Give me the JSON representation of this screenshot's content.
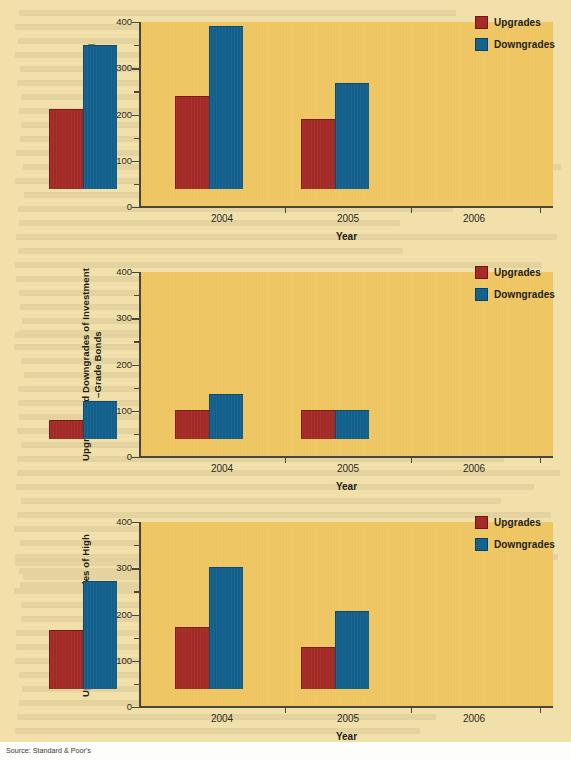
{
  "page": {
    "background_color": "#f1e0a9",
    "plot_background_color": "#eec561",
    "source_note": "Source: Standard & Poor's"
  },
  "colors": {
    "upgrades": "#a62a27",
    "downgrades": "#13628f",
    "axis": "#4a463c",
    "text": "#1d1d1a"
  },
  "legend": {
    "upgrades_label": "Upgrades",
    "downgrades_label": "Downgrades"
  },
  "axis": {
    "y_ticks": [
      "400",
      "300",
      "200",
      "100",
      "0"
    ],
    "x_categories": [
      "2004",
      "2005",
      "2006"
    ],
    "x_title": "Year"
  },
  "chart_data": [
    {
      "id": "chart1",
      "type": "bar",
      "title": "",
      "xlabel": "Year",
      "ylabel": "Total Number of Upgrades and Downgrades",
      "ylim": [
        0,
        400
      ],
      "yticks": [
        0,
        100,
        200,
        300,
        400
      ],
      "grid": false,
      "legend_position": "top-right",
      "categories": [
        "2004",
        "2005",
        "2006"
      ],
      "series": [
        {
          "name": "Upgrades",
          "color": "#a62a27",
          "values": [
            170,
            200,
            150
          ]
        },
        {
          "name": "Downgrades",
          "color": "#13628f",
          "values": [
            310,
            350,
            227
          ]
        }
      ]
    },
    {
      "id": "chart2",
      "type": "bar",
      "title": "",
      "xlabel": "Year",
      "ylabel": "Upgrades and Downgrades of Investment–Grade Bonds",
      "ylim": [
        0,
        400
      ],
      "yticks": [
        0,
        100,
        200,
        300,
        400
      ],
      "grid": false,
      "legend_position": "top-right",
      "categories": [
        "2004",
        "2005",
        "2006"
      ],
      "series": [
        {
          "name": "Upgrades",
          "color": "#a62a27",
          "values": [
            40,
            60,
            60
          ]
        },
        {
          "name": "Downgrades",
          "color": "#13628f",
          "values": [
            80,
            95,
            60
          ]
        }
      ]
    },
    {
      "id": "chart3",
      "type": "bar",
      "title": "",
      "xlabel": "Year",
      "ylabel": "Upgrades and Downgrades of High–Yield Bonds",
      "ylim": [
        0,
        400
      ],
      "yticks": [
        0,
        100,
        200,
        300,
        400
      ],
      "grid": false,
      "legend_position": "top-right",
      "categories": [
        "2004",
        "2005",
        "2006"
      ],
      "series": [
        {
          "name": "Upgrades",
          "color": "#a62a27",
          "values": [
            125,
            133,
            88
          ]
        },
        {
          "name": "Downgrades",
          "color": "#13628f",
          "values": [
            232,
            262,
            167
          ]
        }
      ]
    }
  ],
  "y_titles": {
    "chart1": "Total Number of Upgrades and Downgrades",
    "chart2_line1": "Upgrades and Downgrades of Investment",
    "chart2_line2": "–Grade Bonds",
    "chart3_line1": "Upgrades and Downgrades of High",
    "chart3_line2": "–Yield Bonds"
  }
}
